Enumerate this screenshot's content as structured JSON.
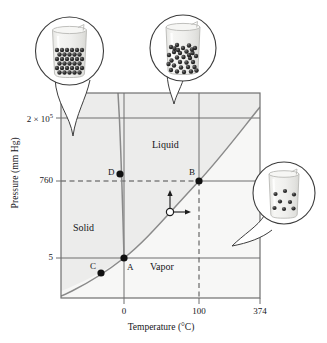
{
  "figure": {
    "axes": {
      "xlabel": "Temperature (°C)",
      "ylabel": "Pressure (mm Hg)",
      "x_ticks": [
        {
          "label": "0",
          "value": 0
        },
        {
          "label": "100",
          "value": 100
        },
        {
          "label": "374",
          "value": 374
        }
      ],
      "y_ticks": [
        {
          "label_base": "2 × 10",
          "label_exp": "5",
          "label": "2 × 10⁵",
          "value": 200000
        },
        {
          "label": "760",
          "value": 760
        },
        {
          "label": "5",
          "value": 5
        }
      ]
    },
    "regions": [
      {
        "name": "solid",
        "label": "Solid"
      },
      {
        "name": "liquid",
        "label": "Liquid"
      },
      {
        "name": "vapor",
        "label": "Vapor"
      }
    ],
    "points": [
      {
        "id": "A",
        "label": "A",
        "description": "triple point",
        "temperature": 0,
        "pressure": 5
      },
      {
        "id": "B",
        "label": "B",
        "description": "normal boiling point",
        "temperature": 100,
        "pressure": 760
      },
      {
        "id": "C",
        "label": "C",
        "description": "point on sublimation curve",
        "temperature": -20,
        "pressure": 1.5
      },
      {
        "id": "D",
        "label": "D",
        "description": "point on fusion curve",
        "temperature": -1,
        "pressure": 900
      }
    ],
    "guide_lines": [
      {
        "name": "pressure-760-dashed",
        "orientation": "horizontal",
        "value": 760,
        "style": "dashed"
      },
      {
        "name": "temperature-100-dashed",
        "orientation": "vertical",
        "value": 100,
        "style": "dashed"
      },
      {
        "name": "pressure-2e5-solid",
        "orientation": "horizontal",
        "value": 200000,
        "style": "solid"
      },
      {
        "name": "pressure-5-solid",
        "orientation": "horizontal",
        "value": 5,
        "style": "solid"
      },
      {
        "name": "temperature-0-solid",
        "orientation": "vertical",
        "value": 0,
        "style": "solid"
      }
    ],
    "curves": [
      {
        "name": "fusion-curve",
        "description": "solid-liquid boundary"
      },
      {
        "name": "vaporization-curve",
        "description": "liquid-vapor boundary"
      },
      {
        "name": "sublimation-curve",
        "description": "solid-vapor boundary"
      }
    ],
    "marker": {
      "name": "state-marker",
      "description": "open circle on vaporization curve with up and right arrows",
      "arrows": [
        "up",
        "right"
      ]
    },
    "callouts": [
      {
        "name": "solid-beaker",
        "phase": "solid",
        "particles": "ordered close-packed"
      },
      {
        "name": "liquid-beaker",
        "phase": "liquid",
        "particles": "disordered close-packed"
      },
      {
        "name": "vapor-beaker",
        "phase": "vapor",
        "particles": "sparse scattered"
      }
    ],
    "colors": {
      "plot_fill": "#ececeb",
      "frame": "#6b6b6b",
      "curve": "#8a8a8a",
      "text": "#16161a",
      "point": "#111111",
      "beaker_glass": "#f2f2f0",
      "beaker_outline": "#b9b9b6",
      "particle": "#2b2b2b"
    }
  }
}
